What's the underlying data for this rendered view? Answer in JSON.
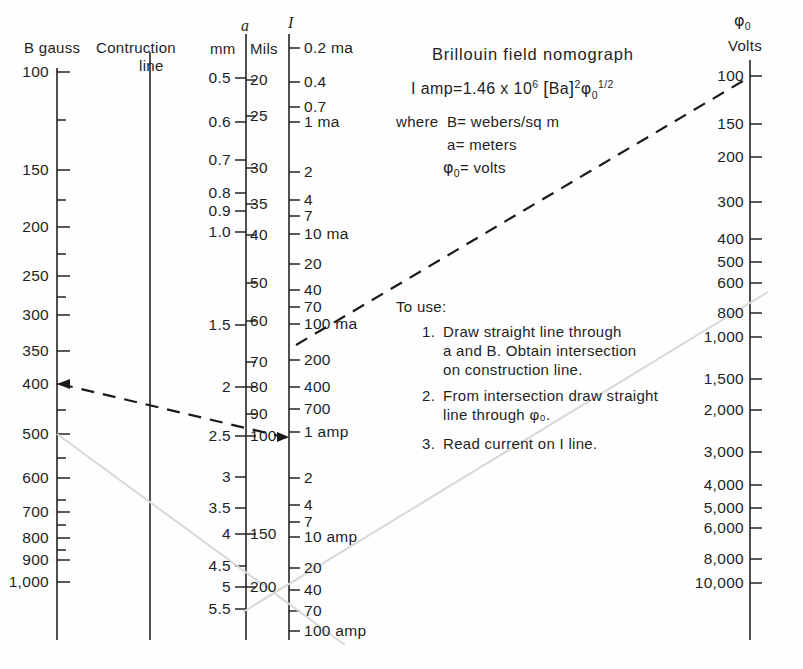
{
  "chart_data": {
    "type": "nomogram",
    "title": "Brillouin field nomograph",
    "formula_parts": {
      "lhs": "I amp=",
      "coefficient": "1.46 x 10",
      "exp10": "6",
      "bracket_open": "[",
      "bracket_body": "Ba",
      "bracket_close": "]",
      "exp_ba": "2",
      "phi": "φ",
      "phi_sub": "0",
      "phi_exp": "1/2"
    },
    "where_lines": [
      "where B= webers/sq m",
      "a = meters",
      "φ = volts"
    ],
    "where_label": "where",
    "definitions": [
      {
        "symbol": "B",
        "eq": "=",
        "text": "webers/sq m"
      },
      {
        "symbol": "a",
        "eq": "=",
        "text": "meters"
      },
      {
        "symbol": "φ",
        "sub": "0",
        "eq": "=",
        "text": "volts"
      }
    ],
    "instructions_heading": "To use:",
    "instructions": [
      {
        "num": "1.",
        "lines": [
          "Draw straight line through",
          "a and B. Obtain intersection",
          "on construction line."
        ]
      },
      {
        "num": "2.",
        "lines": [
          "From intersection draw straight",
          "line through φ₀."
        ]
      },
      {
        "num": "3.",
        "lines": [
          "Read current on I line."
        ]
      }
    ],
    "axes": [
      {
        "id": "b-gauss",
        "header": "B gauss",
        "unit": "gauss",
        "ticks": [
          {
            "label": "100",
            "y": 72,
            "major": true
          },
          {
            "label": "",
            "y": 120,
            "major": false
          },
          {
            "label": "150",
            "y": 170,
            "major": true
          },
          {
            "label": "",
            "y": 200,
            "major": false
          },
          {
            "label": "200",
            "y": 227,
            "major": true
          },
          {
            "label": "",
            "y": 254,
            "major": false
          },
          {
            "label": "250",
            "y": 276,
            "major": true
          },
          {
            "label": "",
            "y": 297,
            "major": false
          },
          {
            "label": "300",
            "y": 315,
            "major": true
          },
          {
            "label": "350",
            "y": 351,
            "major": true
          },
          {
            "label": "400",
            "y": 384,
            "major": true
          },
          {
            "label": "",
            "y": 410,
            "major": false
          },
          {
            "label": "500",
            "y": 434,
            "major": true
          },
          {
            "label": "",
            "y": 458,
            "major": false
          },
          {
            "label": "600",
            "y": 478,
            "major": true
          },
          {
            "label": "",
            "y": 500,
            "major": false
          },
          {
            "label": "700",
            "y": 512,
            "major": true
          },
          {
            "label": "",
            "y": 525,
            "major": false
          },
          {
            "label": "800",
            "y": 538,
            "major": true
          },
          {
            "label": "",
            "y": 550,
            "major": false
          },
          {
            "label": "900",
            "y": 560,
            "major": true
          },
          {
            "label": "1,000",
            "y": 582,
            "major": true
          }
        ]
      },
      {
        "id": "construction-line",
        "header_line1": "Contruction",
        "header_line2": "line"
      },
      {
        "id": "a-mm",
        "header_symbol": "a",
        "header": "mm",
        "ticks": [
          {
            "label": "0.5",
            "y": 78
          },
          {
            "label": "0.6",
            "y": 122
          },
          {
            "label": "0.7",
            "y": 160
          },
          {
            "label": "0.8",
            "y": 193
          },
          {
            "label": "0.9",
            "y": 211
          },
          {
            "label": "1.0",
            "y": 232
          },
          {
            "label": "1.5",
            "y": 325
          },
          {
            "label": "2",
            "y": 387
          },
          {
            "label": "2.5",
            "y": 436
          },
          {
            "label": "3",
            "y": 477
          },
          {
            "label": "3.5",
            "y": 508
          },
          {
            "label": "4",
            "y": 534
          },
          {
            "label": "4.5",
            "y": 566
          },
          {
            "label": "5",
            "y": 587
          },
          {
            "label": "5.5",
            "y": 609
          }
        ]
      },
      {
        "id": "a-mils",
        "header": "Mils",
        "ticks": [
          {
            "label": "20",
            "y": 80
          },
          {
            "label": "25",
            "y": 116
          },
          {
            "label": "30",
            "y": 168
          },
          {
            "label": "35",
            "y": 204
          },
          {
            "label": "40",
            "y": 235
          },
          {
            "label": "50",
            "y": 283
          },
          {
            "label": "60",
            "y": 321
          },
          {
            "label": "70",
            "y": 362
          },
          {
            "label": "80",
            "y": 387
          },
          {
            "label": "90",
            "y": 414
          },
          {
            "label": "100",
            "y": 436
          },
          {
            "label": "150",
            "y": 534
          },
          {
            "label": "200",
            "y": 587
          }
        ]
      },
      {
        "id": "i-current",
        "header_symbol": "I",
        "ticks": [
          {
            "label": "0.2 ma",
            "y": 48
          },
          {
            "label": "0.4",
            "y": 82
          },
          {
            "label": "0.7",
            "y": 107
          },
          {
            "label": "1 ma",
            "y": 122
          },
          {
            "label": "2",
            "y": 172
          },
          {
            "label": "4",
            "y": 200
          },
          {
            "label": "7",
            "y": 216
          },
          {
            "label": "10 ma",
            "y": 234
          },
          {
            "label": "20",
            "y": 264
          },
          {
            "label": "40",
            "y": 290
          },
          {
            "label": "70",
            "y": 307
          },
          {
            "label": "100 ma",
            "y": 324
          },
          {
            "label": "200",
            "y": 360
          },
          {
            "label": "400",
            "y": 387
          },
          {
            "label": "700",
            "y": 409
          },
          {
            "label": "1 amp",
            "y": 432
          },
          {
            "label": "2",
            "y": 478
          },
          {
            "label": "4",
            "y": 505
          },
          {
            "label": "7",
            "y": 522
          },
          {
            "label": "10 amp",
            "y": 537
          },
          {
            "label": "20",
            "y": 568
          },
          {
            "label": "40",
            "y": 590
          },
          {
            "label": "70",
            "y": 611
          },
          {
            "label": "100 amp",
            "y": 631
          }
        ]
      },
      {
        "id": "phi-volts",
        "header_symbol": "φ",
        "header_sub": "0",
        "header": "Volts",
        "ticks": [
          {
            "label": "100",
            "y": 76
          },
          {
            "label": "150",
            "y": 124
          },
          {
            "label": "200",
            "y": 157
          },
          {
            "label": "300",
            "y": 202
          },
          {
            "label": "400",
            "y": 239
          },
          {
            "label": "500",
            "y": 262
          },
          {
            "label": "600",
            "y": 283
          },
          {
            "label": "800",
            "y": 313
          },
          {
            "label": "1,000",
            "y": 337
          },
          {
            "label": "1,500",
            "y": 379
          },
          {
            "label": "2,000",
            "y": 410
          },
          {
            "label": "3,000",
            "y": 452
          },
          {
            "label": "4,000",
            "y": 485
          },
          {
            "label": "5,000",
            "y": 508
          },
          {
            "label": "6,000",
            "y": 528
          },
          {
            "label": "8,000",
            "y": 559
          },
          {
            "label": "10,000",
            "y": 583
          }
        ]
      }
    ],
    "example_lines": [
      {
        "name": "line-a-to-b",
        "style": "dashed",
        "from": {
          "x": 57,
          "y": 384,
          "axis": "b-gauss",
          "value": "400"
        },
        "to": {
          "x": 286,
          "y": 438,
          "axis": "a-mm",
          "value": "2.5"
        },
        "arrow_at": "from"
      },
      {
        "name": "line-construction-to-phi",
        "style": "dashed",
        "from": {
          "x": 296,
          "y": 344,
          "axis": "i-current",
          "value": "100 ma"
        },
        "to": {
          "x": 750,
          "y": 77,
          "axis": "phi-volts",
          "value": "100"
        },
        "arrow_at": "none"
      },
      {
        "name": "ghost-line-1",
        "style": "faint",
        "from": {
          "x": 57,
          "y": 434
        },
        "to": {
          "x": 340,
          "y": 640
        }
      },
      {
        "name": "ghost-line-2",
        "style": "faint",
        "from": {
          "x": 246,
          "y": 600
        },
        "to": {
          "x": 760,
          "y": 300
        }
      }
    ],
    "axis_geometry": {
      "b_x": 57,
      "b_top": 68,
      "b_bottom": 640,
      "c_x": 150,
      "c_top": 52,
      "c_bottom": 640,
      "a_x": 246,
      "a_top": 34,
      "a_bottom": 640,
      "i_x": 289,
      "i_top": 34,
      "i_bottom": 640,
      "p_x": 750,
      "p_top": 60,
      "p_bottom": 640
    }
  }
}
